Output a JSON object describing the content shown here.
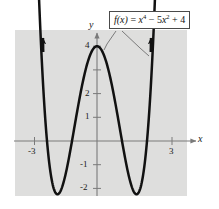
{
  "figure": {
    "kind": "function-graph",
    "background_color": "#ffffff",
    "plot_area_color": "#dededd",
    "curve_color": "#111111",
    "axis_color": "#7a7a7a"
  },
  "formula": {
    "lhs": "f(x)",
    "equals": " = ",
    "term1_base": "x",
    "term1_exp": "4",
    "op1": " − ",
    "term2_coeff": "5",
    "term2_base": "x",
    "term2_exp": "2",
    "op2": " + ",
    "term3": "4",
    "plain": "f(x) = x⁴ − 5x² + 4"
  },
  "axes": {
    "x_label": "x",
    "y_label": "y",
    "x_ticks": [
      {
        "value": -3,
        "label": "-3"
      },
      {
        "value": 3,
        "label": "3"
      }
    ],
    "y_ticks": [
      {
        "value": 4,
        "label": "4"
      },
      {
        "value": 3,
        "label": ""
      },
      {
        "value": 2,
        "label": "2"
      },
      {
        "value": 1,
        "label": "1"
      },
      {
        "value": -1,
        "label": "-1"
      },
      {
        "value": -2,
        "label": "-2"
      }
    ],
    "x_range": [
      -3.3,
      3.3
    ],
    "y_range": [
      -2.6,
      4.7
    ]
  },
  "chart_data": {
    "type": "line",
    "title": "",
    "xlabel": "x",
    "ylabel": "y",
    "expression": "f(x) = x^4 - 5x^2 + 4",
    "xlim": [
      -3.3,
      3.3
    ],
    "ylim": [
      -2.6,
      4.7
    ],
    "grid": false,
    "legend": "none",
    "annotations": [
      {
        "text": "f(x) = x⁴ − 5x² + 4",
        "type": "callout-box"
      }
    ],
    "series": [
      {
        "name": "f(x) = x^4 - 5x^2 + 4",
        "color": "#111111",
        "x": [
          -2.45,
          -2.3,
          -2.2,
          -2.1,
          -2.0,
          -1.9,
          -1.8,
          -1.7,
          -1.58,
          -1.5,
          -1.4,
          -1.3,
          -1.2,
          -1.1,
          -1.0,
          -0.9,
          -0.8,
          -0.7,
          -0.6,
          -0.5,
          -0.4,
          -0.3,
          -0.2,
          -0.1,
          0.0,
          0.1,
          0.2,
          0.3,
          0.4,
          0.5,
          0.6,
          0.7,
          0.8,
          0.9,
          1.0,
          1.1,
          1.2,
          1.3,
          1.4,
          1.5,
          1.58,
          1.7,
          1.8,
          1.9,
          2.0,
          2.1,
          2.2,
          2.3,
          2.45
        ],
        "y": [
          5.98,
          1.53,
          0.23,
          -0.6,
          -1.0,
          -1.02,
          -0.71,
          -0.1,
          0.0,
          -0.19,
          -0.96,
          -1.59,
          -2.13,
          -2.56,
          -2.8,
          -2.92,
          -2.92,
          -2.8,
          -2.55,
          -2.19,
          -1.73,
          -1.19,
          -0.6,
          0.0,
          0.0,
          0.0,
          0.0,
          0.0,
          0.0,
          0.0,
          0.0,
          0.0,
          0.0,
          0.0,
          0.0,
          0.0,
          0.0,
          0.0,
          0.0,
          0.0,
          0.0,
          0.0,
          0.0,
          0.0,
          0.0,
          0.0,
          0.0,
          0.0,
          0.0
        ]
      }
    ],
    "key_points": {
      "local_max": {
        "x": 0,
        "y": 4
      },
      "local_minima": [
        {
          "x": -1.581,
          "y": -2.25
        },
        {
          "x": 1.581,
          "y": -2.25
        }
      ],
      "roots": [
        -2,
        -1,
        1,
        2
      ]
    }
  }
}
